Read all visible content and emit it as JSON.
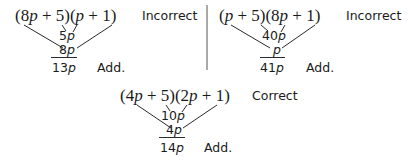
{
  "panels": [
    {
      "expression": {
        "p1": "(8",
        "v1": "p",
        "p2": " + 5)(",
        "v2": "p",
        "p3": " + 1)"
      },
      "verdict": "Incorrect",
      "inner_term": {
        "num": "5",
        "var": "p"
      },
      "outer_term": {
        "num": "8",
        "var": "p"
      },
      "sum": {
        "num": "13",
        "var": "p"
      },
      "sum_label": "Add."
    },
    {
      "expression": {
        "p1": "(",
        "v1": "p",
        "p2": " + 5)(8",
        "v2": "p",
        "p3": " + 1)"
      },
      "verdict": "Incorrect",
      "inner_term": {
        "num": "40",
        "var": "p"
      },
      "outer_term": {
        "num": "",
        "var": "p"
      },
      "sum": {
        "num": "41",
        "var": "p"
      },
      "sum_label": "Add."
    },
    {
      "expression": {
        "p1": "(4",
        "v1": "p",
        "p2": " + 5)(2",
        "v2": "p",
        "p3": " + 1)"
      },
      "verdict": "Correct",
      "inner_term": {
        "num": "10",
        "var": "p"
      },
      "outer_term": {
        "num": "4",
        "var": "p"
      },
      "sum": {
        "num": "14",
        "var": "p"
      },
      "sum_label": "Add."
    }
  ]
}
